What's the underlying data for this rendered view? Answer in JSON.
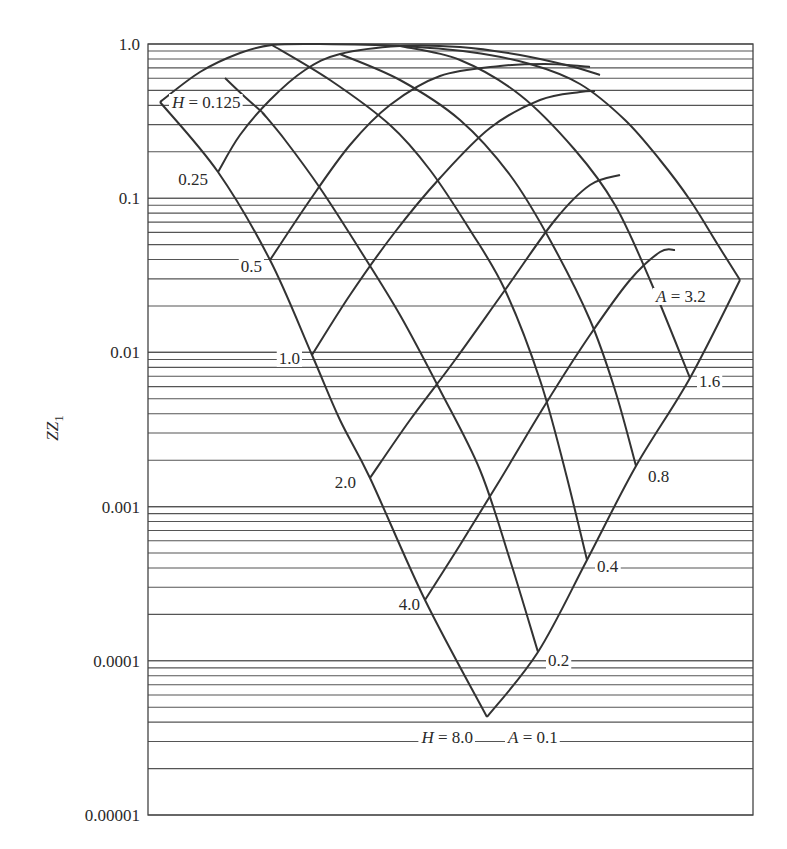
{
  "chart_data": {
    "type": "line",
    "title": "",
    "xlabel": "",
    "ylabel": "ZZ1",
    "yscale": "log",
    "ylim": [
      1e-05,
      1.0
    ],
    "y_ticks": [
      "1.0",
      "0.1",
      "0.01",
      "0.001",
      "0.0001",
      "0.00001"
    ],
    "grid": "horizontal log minor gridlines",
    "legend": "none",
    "h_labels": [
      {
        "text": "H = 0.125",
        "value": 0.125,
        "italic_prefix": "H"
      },
      {
        "text": "0.25",
        "value": 0.25
      },
      {
        "text": "0.5",
        "value": 0.5
      },
      {
        "text": "1.0",
        "value": 1.0
      },
      {
        "text": "2.0",
        "value": 2.0
      },
      {
        "text": "4.0",
        "value": 4.0
      },
      {
        "text": "H = 8.0",
        "value": 8.0,
        "italic_prefix": "H"
      }
    ],
    "a_labels": [
      {
        "text": "A = 0.1",
        "value": 0.1,
        "italic_prefix": "A"
      },
      {
        "text": "0.2",
        "value": 0.2
      },
      {
        "text": "0.4",
        "value": 0.4
      },
      {
        "text": "0.8",
        "value": 0.8
      },
      {
        "text": "1.6",
        "value": 1.6
      },
      {
        "text": "A = 3.2",
        "value": 3.2,
        "italic_prefix": "A"
      }
    ],
    "h_curve_start_zz1": {
      "0.125": 0.45,
      "0.25": 0.15,
      "0.5": 0.039,
      "1.0": 0.0095,
      "2.0": 0.0015,
      "4.0": 0.00025,
      "8.0": 3e-05
    },
    "a_curve_end_zz1": {
      "0.1": 3e-05,
      "0.2": 0.00011,
      "0.4": 0.00045,
      "0.8": 0.0017,
      "1.6": 0.0065,
      "3.2": 0.02
    },
    "peak_zz1": 1.0
  },
  "axis": {
    "ylabel_main": "ZZ",
    "ylabel_sub": "1"
  }
}
